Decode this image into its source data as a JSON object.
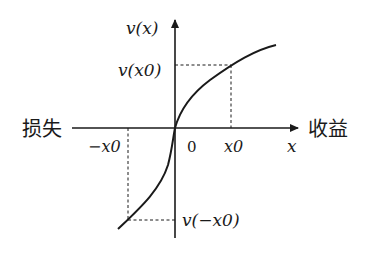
{
  "diagram": {
    "type": "prospect-theory-value-function",
    "y_axis_label": "v(x)",
    "x_axis_label": "x",
    "left_label": "损失",
    "right_label": "收益",
    "origin_label": "0",
    "x0_label": "x0",
    "neg_x0_label": "−x0",
    "v_x0_label": "v(x0)",
    "v_neg_x0_label": "v(−x0)",
    "colors": {
      "ink": "#1a1a1a",
      "background": "#ffffff"
    }
  }
}
